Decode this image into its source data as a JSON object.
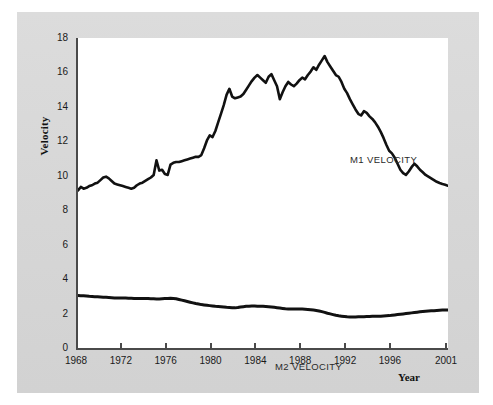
{
  "figure": {
    "background_color": "#d8d8d8",
    "plot_background_color": "#ffffff",
    "axis_color": "#4a4a4a",
    "line_color": "#111111"
  },
  "axes": {
    "y_axis_title": "Velocity",
    "x_axis_title": "Year",
    "y_ticks": [
      "0",
      "2",
      "4",
      "6",
      "8",
      "10",
      "12",
      "14",
      "16",
      "18"
    ],
    "x_ticks": [
      "1968",
      "1972",
      "1976",
      "1980",
      "1984",
      "1988",
      "1992",
      "1996",
      "2001"
    ]
  },
  "annotations": {
    "m1_label": "M1 VELOCITY",
    "m2_label": "M2 VELOCITY"
  },
  "chart_data": {
    "type": "line",
    "title": "",
    "xlabel": "Year",
    "ylabel": "Velocity",
    "xlim": [
      1968,
      2001
    ],
    "ylim": [
      0,
      18
    ],
    "ytick_values": [
      0,
      2,
      4,
      6,
      8,
      10,
      12,
      14,
      16,
      18
    ],
    "xtick_values": [
      1968,
      1972,
      1976,
      1980,
      1984,
      1988,
      1992,
      1996,
      2001
    ],
    "grid": false,
    "legend": "inline-annotation",
    "x": [
      1968.0,
      1968.25,
      1968.5,
      1968.75,
      1969.0,
      1969.25,
      1969.5,
      1969.75,
      1970.0,
      1970.25,
      1970.5,
      1970.75,
      1971.0,
      1971.25,
      1971.5,
      1971.75,
      1972.0,
      1972.25,
      1972.5,
      1972.75,
      1973.0,
      1973.25,
      1973.5,
      1973.75,
      1974.0,
      1974.25,
      1974.5,
      1974.75,
      1975.0,
      1975.25,
      1975.5,
      1975.75,
      1976.0,
      1976.25,
      1976.5,
      1976.75,
      1977.0,
      1977.25,
      1977.5,
      1977.75,
      1978.0,
      1978.25,
      1978.5,
      1978.75,
      1979.0,
      1979.25,
      1979.5,
      1979.75,
      1980.0,
      1980.25,
      1980.5,
      1980.75,
      1981.0,
      1981.25,
      1981.5,
      1981.75,
      1982.0,
      1982.25,
      1982.5,
      1982.75,
      1983.0,
      1983.25,
      1983.5,
      1983.75,
      1984.0,
      1984.25,
      1984.5,
      1984.75,
      1985.0,
      1985.25,
      1985.5,
      1985.75,
      1986.0,
      1986.25,
      1986.5,
      1986.75,
      1987.0,
      1987.25,
      1987.5,
      1987.75,
      1988.0,
      1988.25,
      1988.5,
      1988.75,
      1989.0,
      1989.25,
      1989.5,
      1989.75,
      1990.0,
      1990.25,
      1990.5,
      1990.75,
      1991.0,
      1991.25,
      1991.5,
      1991.75,
      1992.0,
      1992.25,
      1992.5,
      1992.75,
      1993.0,
      1993.25,
      1993.5,
      1993.75,
      1994.0,
      1994.25,
      1994.5,
      1994.75,
      1995.0,
      1995.25,
      1995.5,
      1995.75,
      1996.0,
      1996.25,
      1996.5,
      1996.75,
      1997.0,
      1997.25,
      1997.5,
      1997.75,
      1998.0,
      1998.25,
      1998.5,
      1998.75,
      1999.0,
      1999.25,
      1999.5,
      1999.75,
      2000.0,
      2000.25,
      2000.5,
      2000.75,
      2001.0
    ],
    "series": [
      {
        "name": "M1 VELOCITY",
        "label": "M1 VELOCITY",
        "color": "#111111",
        "values": [
          9.15,
          9.35,
          9.25,
          9.3,
          9.4,
          9.45,
          9.55,
          9.6,
          9.75,
          9.9,
          9.95,
          9.85,
          9.7,
          9.55,
          9.5,
          9.45,
          9.4,
          9.35,
          9.3,
          9.25,
          9.3,
          9.45,
          9.55,
          9.6,
          9.7,
          9.8,
          9.9,
          10.05,
          10.9,
          10.3,
          10.35,
          10.1,
          10.05,
          10.65,
          10.75,
          10.8,
          10.8,
          10.85,
          10.9,
          10.95,
          11.0,
          11.05,
          11.1,
          11.1,
          11.2,
          11.6,
          12.05,
          12.35,
          12.25,
          12.6,
          13.1,
          13.6,
          14.1,
          14.7,
          15.05,
          14.6,
          14.5,
          14.55,
          14.6,
          14.75,
          15.0,
          15.25,
          15.5,
          15.7,
          15.85,
          15.7,
          15.55,
          15.4,
          15.75,
          15.9,
          15.55,
          15.2,
          14.45,
          14.85,
          15.2,
          15.45,
          15.3,
          15.2,
          15.35,
          15.55,
          15.7,
          15.6,
          15.85,
          16.05,
          16.3,
          16.15,
          16.45,
          16.7,
          16.95,
          16.6,
          16.35,
          16.1,
          15.85,
          15.75,
          15.45,
          15.05,
          14.8,
          14.45,
          14.15,
          13.85,
          13.6,
          13.5,
          13.75,
          13.65,
          13.45,
          13.3,
          13.1,
          12.85,
          12.55,
          12.2,
          11.8,
          11.45,
          11.3,
          11.05,
          10.7,
          10.35,
          10.15,
          10.05,
          10.25,
          10.5,
          10.7,
          10.55,
          10.35,
          10.2,
          10.05,
          9.95,
          9.85,
          9.75,
          9.65,
          9.58,
          9.52,
          9.48,
          9.42
        ]
      },
      {
        "name": "M2 VELOCITY",
        "label": "M2 VELOCITY",
        "color": "#111111",
        "values": [
          3.05,
          3.04,
          3.03,
          3.02,
          3.0,
          2.99,
          2.98,
          2.97,
          2.96,
          2.95,
          2.94,
          2.93,
          2.92,
          2.91,
          2.91,
          2.9,
          2.9,
          2.9,
          2.89,
          2.89,
          2.88,
          2.88,
          2.88,
          2.87,
          2.87,
          2.87,
          2.86,
          2.86,
          2.85,
          2.85,
          2.86,
          2.87,
          2.88,
          2.89,
          2.88,
          2.86,
          2.82,
          2.78,
          2.74,
          2.7,
          2.66,
          2.62,
          2.58,
          2.55,
          2.52,
          2.5,
          2.48,
          2.46,
          2.44,
          2.42,
          2.41,
          2.4,
          2.38,
          2.36,
          2.35,
          2.34,
          2.33,
          2.35,
          2.38,
          2.4,
          2.42,
          2.43,
          2.44,
          2.44,
          2.43,
          2.42,
          2.42,
          2.41,
          2.4,
          2.38,
          2.36,
          2.34,
          2.32,
          2.3,
          2.28,
          2.27,
          2.26,
          2.26,
          2.27,
          2.27,
          2.26,
          2.25,
          2.24,
          2.22,
          2.2,
          2.18,
          2.15,
          2.11,
          2.07,
          2.02,
          1.98,
          1.94,
          1.9,
          1.87,
          1.85,
          1.83,
          1.81,
          1.8,
          1.8,
          1.8,
          1.81,
          1.82,
          1.82,
          1.83,
          1.83,
          1.84,
          1.84,
          1.85,
          1.85,
          1.86,
          1.87,
          1.88,
          1.9,
          1.92,
          1.94,
          1.96,
          1.98,
          2.0,
          2.02,
          2.04,
          2.06,
          2.08,
          2.1,
          2.12,
          2.14,
          2.15,
          2.16,
          2.17,
          2.18,
          2.19,
          2.2,
          2.2,
          2.21
        ]
      }
    ]
  }
}
